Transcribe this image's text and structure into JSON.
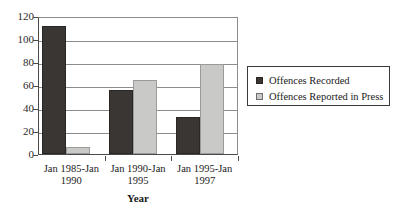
{
  "chart_data": {
    "type": "bar",
    "title": "",
    "xlabel": "Year",
    "ylabel": "",
    "categories": [
      "Jan 1985-Jan 1990",
      "Jan 1990-Jan 1995",
      "Jan 1995-Jan 1997"
    ],
    "category_lines": [
      [
        "Jan 1985-Jan",
        "1990"
      ],
      [
        "Jan 1990-Jan",
        "1995"
      ],
      [
        "Jan 1995-Jan",
        "1997"
      ]
    ],
    "series": [
      {
        "name": "Offences Recorded",
        "values": [
          111,
          56,
          32
        ],
        "color": "#3a3634"
      },
      {
        "name": "Offences Reported in Press",
        "values": [
          6,
          64,
          78
        ],
        "color": "#c9c9c7"
      }
    ],
    "ylim": [
      0,
      120
    ],
    "yticks": [
      0,
      20,
      40,
      60,
      80,
      100,
      120
    ],
    "ytick_labels": [
      "0",
      "20",
      "40",
      "60",
      "80",
      "100",
      "120"
    ],
    "grid": true,
    "legend_position": "right"
  },
  "legend": {
    "items": [
      {
        "label": "Offences Recorded",
        "swatch": "dark"
      },
      {
        "label": "Offences Reported in Press",
        "swatch": "light"
      }
    ]
  }
}
